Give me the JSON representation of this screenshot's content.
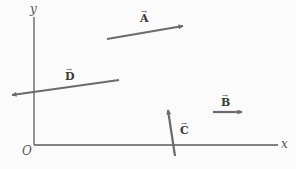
{
  "diagram": {
    "type": "vector-diagram",
    "axes": {
      "x_label": "x",
      "y_label": "y",
      "origin_label": "O",
      "origin": [
        34,
        145
      ],
      "x_axis_end": [
        278,
        145
      ],
      "y_axis_end": [
        34,
        17
      ]
    },
    "vectors": [
      {
        "name": "A",
        "label": "A",
        "arrow": "→",
        "tail": [
          107,
          39
        ],
        "head": [
          183,
          26
        ],
        "label_pos": [
          140,
          22
        ]
      },
      {
        "name": "B",
        "label": "B",
        "arrow": "→",
        "tail": [
          213,
          112
        ],
        "head": [
          242,
          112
        ],
        "label_pos": [
          221,
          106
        ]
      },
      {
        "name": "C",
        "label": "C",
        "arrow": "→",
        "tail": [
          175,
          156
        ],
        "head": [
          168,
          110
        ],
        "label_pos": [
          180,
          134
        ]
      },
      {
        "name": "D",
        "label": "D",
        "arrow": "→",
        "tail": [
          119,
          80
        ],
        "head": [
          12,
          95
        ],
        "label_pos": [
          65,
          80
        ]
      }
    ],
    "colors": {
      "axis": "#5a5a5a",
      "vector": "#6b6b6b",
      "label": "#3a3a3a",
      "background": "#fbfbfb"
    }
  }
}
